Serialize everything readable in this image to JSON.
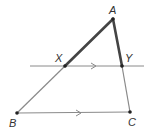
{
  "diagram": {
    "colors": {
      "thin_line": "#8a8a8a",
      "thick_line": "#444444",
      "point": "#222222",
      "label": "#333333"
    },
    "points": {
      "A": {
        "label": "A",
        "x": 113,
        "y": 19
      },
      "B": {
        "label": "B",
        "x": 17,
        "y": 113
      },
      "C": {
        "label": "C",
        "x": 130,
        "y": 112
      },
      "X": {
        "label": "X",
        "x": 65,
        "y": 66
      },
      "Y": {
        "label": "Y",
        "x": 122,
        "y": 66
      }
    },
    "labels": {
      "A": "A",
      "B": "B",
      "C": "C",
      "X": "X",
      "Y": "Y"
    },
    "parallel_marks": [
      "XY line arrow",
      "BC segment arrow"
    ],
    "highlighted_segments": [
      "AX",
      "AY"
    ]
  }
}
